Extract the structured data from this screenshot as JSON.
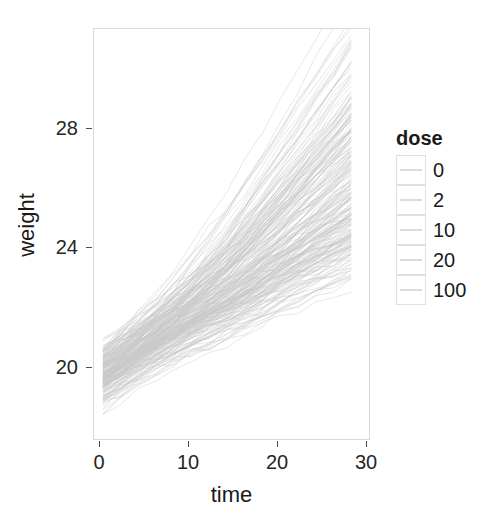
{
  "chart_data": {
    "type": "line",
    "title": "",
    "xlabel": "time",
    "ylabel": "weight",
    "xlim": [
      0,
      31
    ],
    "ylim": [
      18.0,
      31.2
    ],
    "xticks": [
      0,
      10,
      20,
      30
    ],
    "yticks": [
      20,
      24,
      28
    ],
    "grid": false,
    "legend": {
      "title": "dose",
      "position": "right",
      "entries": [
        {
          "label": "0",
          "color": "#dcdcdc"
        },
        {
          "label": "2",
          "color": "#dcdcdc"
        },
        {
          "label": "10",
          "color": "#dcdcdc"
        },
        {
          "label": "20",
          "color": "#dcdcdc"
        },
        {
          "label": "100",
          "color": "#dcdcdc"
        }
      ]
    },
    "x": [
      1,
      3,
      5,
      7,
      9,
      11,
      13,
      15,
      17,
      19,
      21,
      23,
      25,
      27,
      29
    ],
    "series": [
      {
        "name": "dose 0",
        "n_subjects": 50,
        "values": [
          19.8,
          20.2,
          20.6,
          21.0,
          21.3,
          21.6,
          21.9,
          22.2,
          22.5,
          22.8,
          23.1,
          23.4,
          23.7,
          24.0,
          24.3
        ]
      },
      {
        "name": "dose 2",
        "n_subjects": 50,
        "values": [
          20.0,
          20.4,
          20.8,
          21.2,
          21.5,
          21.8,
          22.1,
          22.4,
          22.8,
          23.2,
          23.6,
          24.0,
          24.4,
          24.8,
          25.2
        ]
      },
      {
        "name": "dose 10",
        "n_subjects": 50,
        "values": [
          20.1,
          20.5,
          20.9,
          21.3,
          21.7,
          22.1,
          22.5,
          22.9,
          23.3,
          23.8,
          24.3,
          24.8,
          25.3,
          25.8,
          26.3
        ]
      },
      {
        "name": "dose 20",
        "n_subjects": 50,
        "values": [
          20.2,
          20.6,
          21.0,
          21.4,
          21.9,
          22.4,
          22.9,
          23.4,
          24.0,
          24.6,
          25.2,
          25.8,
          26.4,
          27.0,
          27.6
        ]
      },
      {
        "name": "dose 100",
        "n_subjects": 50,
        "values": [
          20.3,
          20.7,
          21.2,
          21.7,
          22.2,
          22.8,
          23.4,
          24.0,
          24.7,
          25.4,
          26.1,
          26.8,
          27.5,
          28.2,
          28.9
        ]
      }
    ],
    "range_summary": {
      "weight_min_observed": 18.4,
      "weight_max_observed": 30.6,
      "time_min_observed": 1,
      "time_max_observed": 29
    }
  },
  "axes": {
    "x_tick_labels": [
      "0",
      "10",
      "20",
      "30"
    ],
    "y_tick_labels": [
      "20",
      "24",
      "28"
    ],
    "x_title": "time",
    "y_title": "weight"
  },
  "legend": {
    "title": "dose",
    "items": [
      "0",
      "2",
      "10",
      "20",
      "100"
    ]
  }
}
